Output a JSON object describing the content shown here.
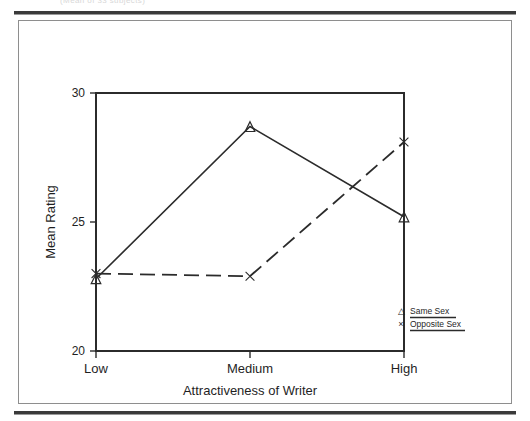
{
  "page": {
    "caption_fragment": "(Mean of 33 subjects)"
  },
  "chart_data": {
    "type": "line",
    "title": "",
    "xlabel": "Attractiveness of Writer",
    "ylabel": "Mean Rating",
    "categories": [
      "Low",
      "Medium",
      "High"
    ],
    "ylim": [
      20,
      30
    ],
    "yticks": [
      20,
      25,
      30
    ],
    "ytick_labels": [
      "20",
      "25",
      "30"
    ],
    "grid": false,
    "legend_position": "bottom-right",
    "series": [
      {
        "name": "Same Sex",
        "marker": "triangle",
        "marker_glyph": "△",
        "line_style": "solid",
        "color": "#2b2b2b",
        "values": [
          22.8,
          28.7,
          25.2
        ]
      },
      {
        "name": "Opposite Sex",
        "marker": "cross",
        "marker_glyph": "×",
        "line_style": "dashed",
        "color": "#2b2b2b",
        "values": [
          23.0,
          22.9,
          28.1
        ]
      }
    ]
  },
  "legend": {
    "items": [
      {
        "marker": "△",
        "label": "Same Sex"
      },
      {
        "marker": "×",
        "label": "Opposite Sex"
      }
    ]
  },
  "axis": {
    "y_tick_top": "30",
    "y_tick_mid": "25",
    "y_tick_bottom": "20",
    "x_cat_low": "Low",
    "x_cat_medium": "Medium",
    "x_cat_high": "High",
    "y_title": "Mean Rating",
    "x_title": "Attractiveness of Writer"
  }
}
